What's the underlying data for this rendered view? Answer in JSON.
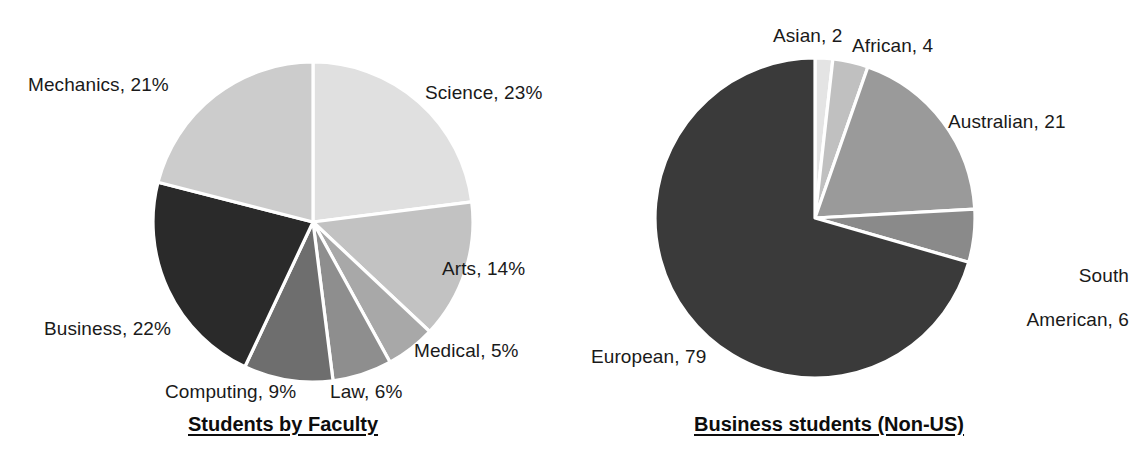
{
  "chart_data": [
    {
      "type": "pie",
      "title": "Students by Faculty",
      "value_suffix": "%",
      "legend_position": "outside-labels",
      "total": 100,
      "categories": [
        "Science",
        "Arts",
        "Medical",
        "Law",
        "Computing",
        "Business",
        "Mechanics"
      ],
      "values": [
        23,
        14,
        5,
        6,
        9,
        22,
        21
      ],
      "labels": [
        "Science, 23%",
        "Arts, 14%",
        "Medical, 5%",
        "Law, 6%",
        "Computing, 9%",
        "Business, 22%",
        "Mechanics, 21%"
      ],
      "colors": [
        "#e0e0e0",
        "#c2c2c2",
        "#a8a8a8",
        "#8e8e8e",
        "#6e6e6e",
        "#2a2a2a",
        "#cccccc"
      ],
      "start_angle_deg": 0,
      "direction": "clockwise",
      "center": [
        313,
        222
      ],
      "radius": 160
    },
    {
      "type": "pie",
      "title": "Business students (Non-US)",
      "value_suffix": "",
      "legend_position": "outside-labels",
      "total": 112,
      "categories": [
        "Asian",
        "African",
        "Australian",
        "South American",
        "European"
      ],
      "values": [
        2,
        4,
        21,
        6,
        79
      ],
      "labels": [
        "Asian, 2",
        "African, 4",
        "Australian, 21",
        "South\nAmerican, 6",
        "European, 79"
      ],
      "colors": [
        "#e4e4e4",
        "#c0c0c0",
        "#9a9a9a",
        "#8a8a8a",
        "#3a3a3a"
      ],
      "start_angle_deg": 0,
      "direction": "clockwise",
      "center": [
        815,
        218
      ],
      "radius": 160
    }
  ],
  "left_chart": {
    "title": "Students by Faculty",
    "labels": {
      "mechanics": "Mechanics, 21%",
      "science": "Science, 23%",
      "arts": "Arts, 14%",
      "medical": "Medical, 5%",
      "law": "Law, 6%",
      "computing": "Computing, 9%",
      "business": "Business, 22%"
    }
  },
  "right_chart": {
    "title": "Business students (Non-US)",
    "labels": {
      "asian": "Asian, 2",
      "african": "African, 4",
      "australian": "Australian, 21",
      "south_american_line1": "South",
      "south_american_line2": "American, 6",
      "european": "European, 79"
    }
  },
  "palette": {
    "background": "#ffffff",
    "text": "#1a1a1a",
    "separator": "#ffffff"
  }
}
